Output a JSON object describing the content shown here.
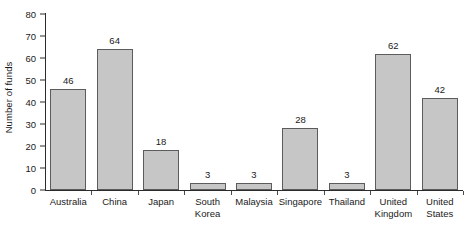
{
  "chart_data": {
    "type": "bar",
    "title": "",
    "subtitle": "",
    "xlabel": "",
    "ylabel": "Number of funds",
    "ylim": [
      0,
      80
    ],
    "yticks": [
      0,
      10,
      20,
      30,
      40,
      50,
      60,
      70,
      80
    ],
    "grid": false,
    "legend": null,
    "legend_position": "none",
    "categories": [
      "Australia",
      "China",
      "Japan",
      "South\nKorea",
      "Malaysia",
      "Singapore",
      "Thailand",
      "United\nKingdom",
      "United\nStates"
    ],
    "values": [
      46,
      64,
      18,
      3,
      3,
      28,
      3,
      62,
      42
    ],
    "data_labels": [
      "46",
      "64",
      "18",
      "3",
      "3",
      "28",
      "3",
      "62",
      "42"
    ],
    "bar_fill_color": "#c6c6c6",
    "bar_edge_color": "#5c5c5c",
    "axis_color": "#2b2b2b",
    "text_color": "#1a1a1a",
    "background_color": "#ffffff"
  },
  "axis": {
    "y_tick_labels": [
      "80",
      "70",
      "60",
      "50",
      "40",
      "30",
      "20",
      "10",
      "0"
    ],
    "y_title": "Number of funds"
  }
}
